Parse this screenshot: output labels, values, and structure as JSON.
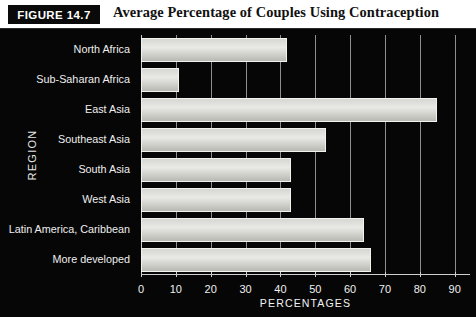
{
  "header": {
    "figure_badge": "FIGURE 14.7",
    "title": "Average Percentage of Couples Using Contraception"
  },
  "chart_data": {
    "type": "bar",
    "orientation": "horizontal",
    "title": "Average Percentage of Couples Using Contraception",
    "xlabel": "PERCENTAGES",
    "ylabel": "REGION",
    "xlim": [
      0,
      94.4
    ],
    "xticks": [
      0,
      10,
      20,
      30,
      40,
      50,
      60,
      70,
      80,
      90
    ],
    "grid": true,
    "legend": null,
    "categories": [
      "North Africa",
      "Sub-Saharan Africa",
      "East Asia",
      "Southeast Asia",
      "South Asia",
      "West Asia",
      "Latin America, Caribbean",
      "More developed"
    ],
    "values": [
      42,
      11,
      85,
      53,
      43,
      43,
      64,
      66
    ]
  },
  "colors": {
    "background": "#060606",
    "panel": "#ffffff",
    "bar_light": "#e9e9e6",
    "bar_dark": "#b9b9b4",
    "axis": "#cfcfcf",
    "grid": "#8e8e8e",
    "text": "#eeeeee",
    "badge": "#0a0a0a"
  }
}
